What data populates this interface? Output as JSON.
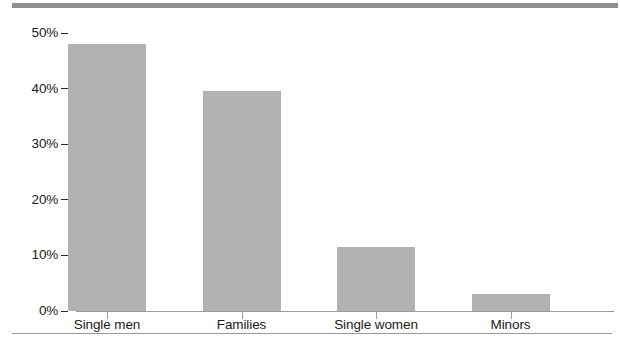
{
  "chart_data": {
    "type": "bar",
    "title": "",
    "subtitle": "",
    "xlabel": "",
    "ylabel": "",
    "categories": [
      "Single men",
      "Families",
      "Single women",
      "Minors"
    ],
    "values": [
      48,
      39.5,
      11.5,
      3
    ],
    "value_labels": [
      "48%",
      "39.5%",
      "11.5%",
      "3%"
    ],
    "series": [
      {
        "name": "Share",
        "values": [
          48,
          39.5,
          11.5,
          3
        ]
      }
    ],
    "ylim": [
      0,
      50
    ],
    "y_ticks": [
      0,
      10,
      20,
      30,
      40,
      50
    ],
    "y_tick_labels": [
      "0%",
      "10%",
      "20%",
      "30%",
      "40%",
      "50%"
    ],
    "grid": false,
    "legend": false,
    "legend_position": "none",
    "bar_color": "#b2b2b2",
    "axis_color": "#9b9b9b",
    "text_color": "#1a1a1a",
    "rule_color": "#8f8f8f"
  },
  "decorations": {
    "top_rule": "thick-gray-rule",
    "bottom_rule": "thin-gray-rule"
  }
}
